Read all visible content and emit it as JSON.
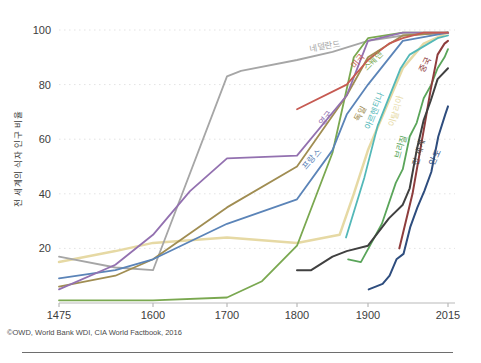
{
  "page": {
    "background": "#ffffff"
  },
  "chart": {
    "y_axis_title": "전 세계의 식자 인구 비율",
    "source_note": "©OWD, World Bank WDI, CIA World Factbook, 2016"
  },
  "chart_data": {
    "type": "line",
    "title": "",
    "xlabel": "",
    "ylabel": "전 세계의 식자 인구 비율",
    "source": "©OWD, World Bank WDI, CIA World Factbook, 2016",
    "x_ticks": [
      1475,
      1600,
      1700,
      1800,
      1900,
      2015
    ],
    "y_ticks": [
      20,
      40,
      60,
      80,
      100
    ],
    "xlim": [
      1475,
      2015
    ],
    "ylim": [
      0,
      100
    ],
    "grid": "faint dotted horizontal gridlines at each y tick",
    "legend_position": "inline rotated labels placed along each line",
    "series": [
      {
        "id": "italy",
        "name": "이탈리아",
        "color": "#e6d9a4",
        "width": 2.5,
        "points": [
          [
            1475,
            15
          ],
          [
            1550,
            19
          ],
          [
            1600,
            22
          ],
          [
            1700,
            24
          ],
          [
            1800,
            22
          ],
          [
            1860,
            25
          ],
          [
            1880,
            40
          ],
          [
            1900,
            56
          ],
          [
            1950,
            86
          ],
          [
            1980,
            95
          ],
          [
            2015,
            99
          ]
        ],
        "label": {
          "year": 1944,
          "value": 70,
          "angle": -75
        }
      },
      {
        "id": "netherlands",
        "name": "네덜란드",
        "color": "#a6a6a6",
        "width": 1.8,
        "points": [
          [
            1475,
            17
          ],
          [
            1550,
            13
          ],
          [
            1600,
            12
          ],
          [
            1700,
            83
          ],
          [
            1720,
            85
          ],
          [
            1800,
            89
          ],
          [
            1850,
            92
          ],
          [
            1900,
            96
          ],
          [
            1950,
            98
          ],
          [
            2015,
            99
          ]
        ],
        "label": {
          "year": 1840,
          "value": 93,
          "angle": -10
        }
      },
      {
        "id": "sweden",
        "name": "스웨덴",
        "color": "#7aa850",
        "width": 1.8,
        "points": [
          [
            1475,
            1
          ],
          [
            1600,
            1
          ],
          [
            1700,
            2
          ],
          [
            1750,
            8
          ],
          [
            1800,
            21
          ],
          [
            1850,
            55
          ],
          [
            1880,
            90
          ],
          [
            1900,
            97
          ],
          [
            1950,
            99
          ],
          [
            2015,
            99
          ]
        ],
        "label": {
          "year": 1910,
          "value": 88,
          "angle": -45
        }
      },
      {
        "id": "germany",
        "name": "독일",
        "color": "#a08d52",
        "width": 1.8,
        "points": [
          [
            1475,
            6
          ],
          [
            1550,
            10
          ],
          [
            1600,
            16
          ],
          [
            1700,
            35
          ],
          [
            1800,
            50
          ],
          [
            1870,
            76
          ],
          [
            1900,
            90
          ],
          [
            1950,
            98
          ],
          [
            2015,
            99
          ]
        ],
        "label": {
          "year": 1893,
          "value": 69,
          "angle": -62
        }
      },
      {
        "id": "france",
        "name": "프랑스",
        "color": "#5b84b8",
        "width": 1.8,
        "points": [
          [
            1475,
            9
          ],
          [
            1550,
            12
          ],
          [
            1600,
            16
          ],
          [
            1700,
            29
          ],
          [
            1800,
            38
          ],
          [
            1850,
            56
          ],
          [
            1870,
            69
          ],
          [
            1900,
            80
          ],
          [
            1950,
            96
          ],
          [
            2015,
            99
          ]
        ],
        "label": {
          "year": 1824,
          "value": 52,
          "angle": -50
        }
      },
      {
        "id": "uk",
        "name": "영국",
        "color": "#9371b0",
        "width": 1.8,
        "points": [
          [
            1475,
            5
          ],
          [
            1550,
            14
          ],
          [
            1600,
            25
          ],
          [
            1650,
            41
          ],
          [
            1700,
            53
          ],
          [
            1800,
            54
          ],
          [
            1870,
            76
          ],
          [
            1900,
            96
          ],
          [
            1950,
            99
          ],
          [
            2015,
            99
          ]
        ],
        "label": {
          "year": 1843,
          "value": 67,
          "angle": -52
        }
      },
      {
        "id": "usa",
        "name": "미국",
        "color": "#c65a52",
        "width": 1.8,
        "points": [
          [
            1800,
            71
          ],
          [
            1870,
            80
          ],
          [
            1900,
            89
          ],
          [
            1930,
            95
          ],
          [
            1950,
            97
          ],
          [
            1980,
            99
          ],
          [
            2015,
            99
          ]
        ],
        "label": {
          "year": 1889,
          "value": 88,
          "angle": -50
        }
      },
      {
        "id": "argentina",
        "name": "아르헨티나",
        "color": "#53b8b8",
        "width": 1.8,
        "points": [
          [
            1869,
            24
          ],
          [
            1895,
            46
          ],
          [
            1914,
            65
          ],
          [
            1947,
            86
          ],
          [
            1960,
            91
          ],
          [
            1980,
            94
          ],
          [
            2000,
            97
          ],
          [
            2015,
            98
          ]
        ],
        "label": {
          "year": 1913,
          "value": 70,
          "angle": -68
        }
      },
      {
        "id": "brazil",
        "name": "브라질",
        "color": "#5aa55a",
        "width": 1.8,
        "points": [
          [
            1872,
            16
          ],
          [
            1890,
            15
          ],
          [
            1920,
            29
          ],
          [
            1940,
            44
          ],
          [
            1950,
            49
          ],
          [
            1960,
            61
          ],
          [
            1970,
            66
          ],
          [
            1980,
            75
          ],
          [
            1991,
            80
          ],
          [
            2000,
            86
          ],
          [
            2010,
            90
          ],
          [
            2015,
            93
          ]
        ],
        "label": {
          "year": 1951,
          "value": 57,
          "angle": -75
        }
      },
      {
        "id": "china",
        "name": "중국",
        "color": "#8e3d3d",
        "width": 2,
        "points": [
          [
            1945,
            20
          ],
          [
            1964,
            40
          ],
          [
            1982,
            66
          ],
          [
            1990,
            78
          ],
          [
            2000,
            91
          ],
          [
            2010,
            95
          ],
          [
            2015,
            96
          ]
        ],
        "label": {
          "year": 1986,
          "value": 87,
          "angle": -65
        }
      },
      {
        "id": "world",
        "name": "전 세계",
        "color": "#404040",
        "width": 2,
        "points": [
          [
            1800,
            12
          ],
          [
            1820,
            12
          ],
          [
            1850,
            17
          ],
          [
            1870,
            19
          ],
          [
            1900,
            21
          ],
          [
            1930,
            31
          ],
          [
            1950,
            36
          ],
          [
            1960,
            42
          ],
          [
            1970,
            56
          ],
          [
            1980,
            67
          ],
          [
            1990,
            74
          ],
          [
            2000,
            82
          ],
          [
            2015,
            86
          ]
        ],
        "label": {
          "year": 1977,
          "value": 55,
          "angle": -75
        }
      },
      {
        "id": "india",
        "name": "인도",
        "color": "#2e4d7e",
        "width": 2,
        "points": [
          [
            1901,
            5
          ],
          [
            1911,
            6
          ],
          [
            1921,
            7
          ],
          [
            1931,
            10
          ],
          [
            1941,
            16
          ],
          [
            1951,
            18
          ],
          [
            1961,
            28
          ],
          [
            1971,
            35
          ],
          [
            1981,
            41
          ],
          [
            1991,
            48
          ],
          [
            2001,
            61
          ],
          [
            2011,
            69
          ],
          [
            2015,
            72
          ]
        ],
        "label": {
          "year": 2000,
          "value": 53,
          "angle": -66
        }
      }
    ]
  }
}
